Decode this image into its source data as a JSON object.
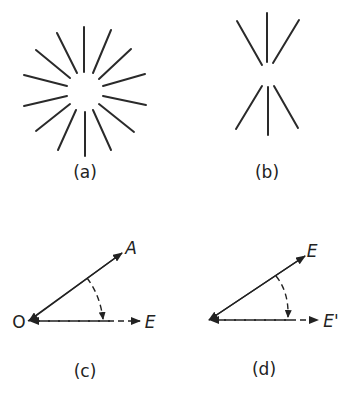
{
  "figure": {
    "panels": [
      {
        "id": "a",
        "caption": "(a)",
        "description": "radial lines around a point (star burst, 14 lines)"
      },
      {
        "id": "b",
        "caption": "(b)",
        "description": "lines converging to a point along vertical axis (6 lines)"
      },
      {
        "id": "c",
        "caption": "(c)",
        "origin_label": "O",
        "vector_label": "A",
        "projection_label": "E"
      },
      {
        "id": "d",
        "caption": "(d)",
        "vector_label": "E",
        "projection_label": "E'"
      }
    ]
  }
}
